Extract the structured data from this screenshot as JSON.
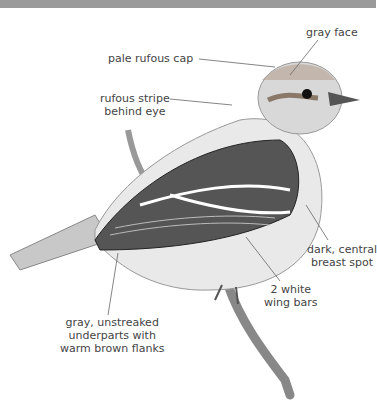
{
  "illustration": {
    "subject": "sparrow-like bird perched on branch",
    "colors": {
      "gray_head": "#b8b8b8",
      "rufous_cap": "#a08070",
      "dark_streak": "#2a2a2a",
      "white": "#ffffff"
    }
  },
  "labels": {
    "gray_face": "gray face",
    "pale_rufous_cap": "pale rufous cap",
    "rufous_stripe_1": "rufous stripe",
    "rufous_stripe_2": "behind eye",
    "breast_spot_1": "dark, central",
    "breast_spot_2": "breast spot",
    "wing_bars_1": "2 white",
    "wing_bars_2": "wing bars",
    "underparts_1": "gray, unstreaked",
    "underparts_2": "underparts with",
    "underparts_3": "warm brown flanks"
  }
}
